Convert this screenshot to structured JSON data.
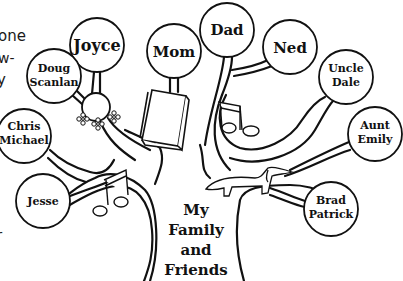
{
  "side_text": {
    "line1": "one",
    "line2": "w-",
    "line3": "y",
    "line4": "r"
  },
  "title": {
    "line1": "My",
    "line2": "Family",
    "line3": "and",
    "line4": "Friends"
  },
  "nodes": {
    "joyce": {
      "line1": "Joyce"
    },
    "doug": {
      "line1": "Doug",
      "line2": "Scanlan"
    },
    "mom": {
      "line1": "Mom"
    },
    "dad": {
      "line1": "Dad"
    },
    "ned": {
      "line1": "Ned"
    },
    "uncle_dale": {
      "line1": "Uncle",
      "line2": "Dale"
    },
    "aunt_emily": {
      "line1": "Aunt",
      "line2": "Emily"
    },
    "chris": {
      "line1": "Chris",
      "line2": "Michael"
    },
    "jesse": {
      "line1": "Jesse"
    },
    "brad": {
      "line1": "Brad",
      "line2": "Patrick"
    }
  },
  "colors": {
    "ink": "#111111",
    "background": "#ffffff"
  }
}
